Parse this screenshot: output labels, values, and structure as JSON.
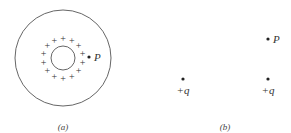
{
  "figure": {
    "panels": [
      {
        "caption": "(a)",
        "description": "Charged spherical shell inside a larger sphere; point P just outside the positive charge ring",
        "outer_circle": {
          "cx": 63,
          "cy": 58,
          "r": 48
        },
        "inner_circle": {
          "cx": 63,
          "cy": 58,
          "r": 12
        },
        "charge_ring": {
          "symbol": "+",
          "count": 14,
          "radius": 20
        },
        "point": {
          "label": "P",
          "x": 89,
          "y": 57
        }
      },
      {
        "caption": "(b)",
        "description": "Two point charges +q with a point P directly above the right charge",
        "charges": [
          {
            "label": "+q",
            "x": 183,
            "y": 79
          },
          {
            "label": "+q",
            "x": 268,
            "y": 79
          }
        ],
        "point": {
          "label": "P",
          "x": 268,
          "y": 39
        }
      }
    ]
  },
  "labels": {
    "a_caption": "(a)",
    "b_caption": "(b)",
    "a_point": "P",
    "b_point": "P",
    "charge_left": "+q",
    "charge_right": "+q",
    "plus_symbol": "+"
  },
  "colors": {
    "line": "#555555",
    "text": "#333333",
    "background": "#ffffff"
  }
}
